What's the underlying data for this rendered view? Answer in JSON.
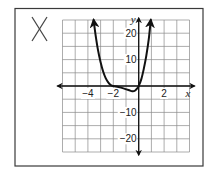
{
  "panel": {
    "mark_label": "X",
    "mark_meaning": "incorrect-answer-mark"
  },
  "chart_data": {
    "type": "line",
    "title": "",
    "xlabel": "x",
    "ylabel": "y",
    "xlim": [
      -6,
      4
    ],
    "ylim": [
      -25,
      25
    ],
    "grid": true,
    "x_grid_step": 1,
    "y_grid_step": 5,
    "x_tick_labels": [
      {
        "value": -4,
        "label": "−4"
      },
      {
        "value": -2,
        "label": "−2"
      },
      {
        "value": 2,
        "label": "2"
      }
    ],
    "y_tick_labels": [
      {
        "value": 20,
        "label": "20"
      },
      {
        "value": 10,
        "label": "10"
      },
      {
        "value": -10,
        "label": "−10"
      },
      {
        "value": -20,
        "label": "−20"
      }
    ],
    "series": [
      {
        "name": "f(x)",
        "description": "polynomial curve with arrows at both ends; touches x-axis at x=-2, small dip below axis, crosses at x=0",
        "x": [
          -3.55,
          -3.4,
          -3.2,
          -3.0,
          -2.8,
          -2.6,
          -2.4,
          -2.2,
          -2.0,
          -1.6,
          -1.2,
          -0.8,
          -0.5,
          -0.3,
          -0.1,
          0.0,
          0.2,
          0.4,
          0.6,
          0.8,
          0.95
        ],
        "y": [
          25,
          19.5,
          13.5,
          9.0,
          5.5,
          3.0,
          1.4,
          0.4,
          0.0,
          -0.4,
          -0.9,
          -1.5,
          -2.0,
          -1.8,
          -0.8,
          0.0,
          2.5,
          6.5,
          11.5,
          18.0,
          25
        ]
      }
    ],
    "arrows": {
      "curve_ends": true,
      "axes_ends": true
    },
    "colors": {
      "curve": "#111111",
      "grid": "#8a8a8a",
      "frame": "#3a3a3a"
    }
  }
}
